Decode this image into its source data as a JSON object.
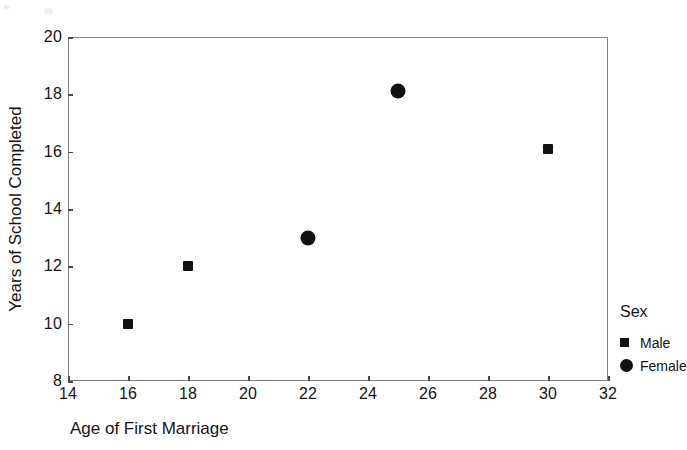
{
  "chart_data": {
    "type": "scatter",
    "title": "",
    "xlabel": "Age of First Marriage",
    "ylabel": "Years of School Completed",
    "xlim": [
      14,
      32
    ],
    "ylim": [
      8,
      20
    ],
    "xticks": [
      14,
      16,
      18,
      20,
      22,
      24,
      26,
      28,
      30,
      32
    ],
    "yticks": [
      8,
      10,
      12,
      14,
      16,
      18,
      20
    ],
    "xtick_labels": [
      "14",
      "16",
      "18",
      "20",
      "22",
      "24",
      "26",
      "28",
      "30",
      "32"
    ],
    "ytick_labels": [
      "8",
      "10",
      "12",
      "14",
      "16",
      "18",
      "20"
    ],
    "grid": false,
    "legend_position": "right",
    "legend_title": "Sex",
    "series": [
      {
        "name": "Male",
        "marker": "square",
        "color": "#111111",
        "points": [
          {
            "x": 16,
            "y": 10.0
          },
          {
            "x": 18,
            "y": 12.0
          },
          {
            "x": 30,
            "y": 16.1
          }
        ]
      },
      {
        "name": "Female",
        "marker": "circle",
        "color": "#111111",
        "points": [
          {
            "x": 22,
            "y": 13.0
          },
          {
            "x": 25,
            "y": 18.1
          }
        ]
      }
    ]
  },
  "axis_titles": {
    "x": "Age of First Marriage",
    "y": "Years of School Completed"
  },
  "legend": {
    "title": "Sex",
    "entries": [
      {
        "label": "Male",
        "marker": "square-marker-icon"
      },
      {
        "label": "Female",
        "marker": "circle-marker-icon"
      }
    ]
  },
  "colors": {
    "marker": "#111111",
    "axis": "#7d7d7d",
    "text": "#141414",
    "background": "#ffffff"
  }
}
